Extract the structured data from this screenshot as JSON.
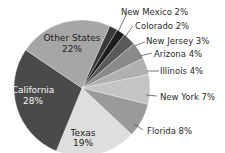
{
  "chart_data": {
    "type": "pie",
    "title": "",
    "categories": [
      "New Mexico",
      "Colorado",
      "New Jersey",
      "Arizona",
      "Illinois",
      "New York",
      "Florida",
      "Texas",
      "California",
      "Other States"
    ],
    "values": [
      2,
      2,
      3,
      4,
      4,
      7,
      8,
      19,
      28,
      22
    ],
    "unit": "%",
    "labels": [
      "New Mexico 2%",
      "Colorado 2%",
      "New Jersey 3%",
      "Arizona 4%",
      "Illinois 4%",
      "New York 7%",
      "Florida 8%",
      "Texas 19%",
      "California 28%",
      "Other States 22%"
    ],
    "colors": [
      "#3a3a3a",
      "#1e1e1e",
      "#5a5a5a",
      "#8a8a8a",
      "#b0b0b0",
      "#c4c4c4",
      "#9a9a9a",
      "#dedede",
      "#4a4a4a",
      "#a6a6a6"
    ],
    "legend": "none (labels placed on/next to slices)",
    "start_angle": "top, clockwise"
  },
  "labels": {
    "new_mexico": "New Mexico 2%",
    "colorado": "Colorado 2%",
    "new_jersey": "New Jersey 3%",
    "arizona": "Arizona 4%",
    "illinois": "Illinois 4%",
    "new_york": "New York 7%",
    "florida": "Florida 8%",
    "texas_name": "Texas",
    "texas_pct": "19%",
    "california_name": "California",
    "california_pct": "28%",
    "other_name": "Other States",
    "other_pct": "22%"
  }
}
